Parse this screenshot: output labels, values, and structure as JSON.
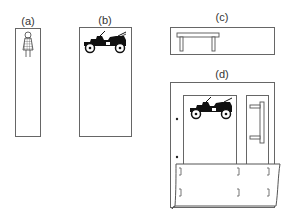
{
  "figure": {
    "panels": [
      {
        "id": "a",
        "label": "(a)",
        "content": "person-figure",
        "description": "tall narrow frame with small checkered-dress figure at top"
      },
      {
        "id": "b",
        "label": "(b)",
        "content": "vintage-car",
        "description": "tall frame with black antique automobile at top"
      },
      {
        "id": "c",
        "label": "(c)",
        "content": "table",
        "description": "wide short frame with simple table at left"
      },
      {
        "id": "d",
        "label": "(d)",
        "content": "composite-scene",
        "description": "frame with car panel, door panel, dots on left edge, and curled sheet with bracket marks overlapping bottom"
      }
    ],
    "colors": {
      "stroke": "#666666",
      "fill": "#111111",
      "background": "#ffffff"
    }
  }
}
